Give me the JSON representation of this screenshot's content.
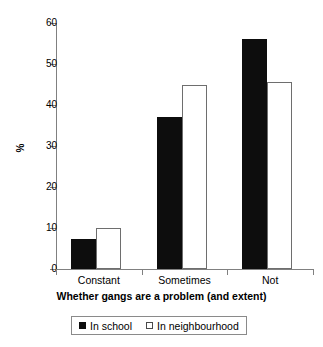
{
  "chart_data": {
    "type": "bar",
    "title": "",
    "subtitle": "",
    "xlabel": "Whether gangs are a problem (and extent)",
    "ylabel": "%",
    "categories": [
      "Constant",
      "Sometimes",
      "Not"
    ],
    "series": [
      {
        "name": "In school",
        "values": [
          7.3,
          37,
          56
        ],
        "color": "#0d0d0d",
        "fill": "solid"
      },
      {
        "name": "In neighbourhood",
        "values": [
          10,
          45,
          45.5
        ],
        "color": "#ffffff",
        "fill": "hollow"
      }
    ],
    "ylim": [
      0,
      60
    ],
    "yticks": [
      0,
      10,
      20,
      30,
      40,
      50,
      60
    ],
    "ytick_labels": [
      "0",
      "10",
      "20",
      "30",
      "40",
      "50",
      "60"
    ],
    "grid": false,
    "legend_position": "bottom"
  },
  "axis": {
    "y_title": "%",
    "x_title": "Whether gangs are a problem (and extent)"
  },
  "legend": {
    "entries": [
      {
        "label": "In school",
        "style": "filled"
      },
      {
        "label": "In neighbourhood",
        "style": "hollow"
      }
    ]
  }
}
